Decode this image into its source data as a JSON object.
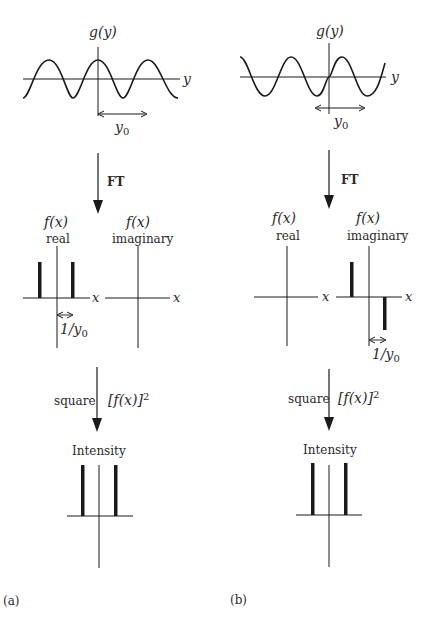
{
  "figure": {
    "panels": [
      {
        "id": "a",
        "caption": "(a)",
        "top_plot": {
          "function_label": "g(y)",
          "axis_label": "y",
          "period_label": "y",
          "period_sub": "0",
          "waveform": "cosine"
        },
        "transform_1": {
          "label": "FT"
        },
        "middle_plots": {
          "real": {
            "function_label": "f(x)",
            "sublabel": "real",
            "axis_label": "x",
            "spacing_label": "1/y",
            "spacing_sub": "0",
            "spikes": [
              {
                "pos": -1,
                "height": 1
              },
              {
                "pos": 1,
                "height": 1
              }
            ]
          },
          "imaginary": {
            "function_label": "f(x)",
            "sublabel": "imaginary",
            "axis_label": "x",
            "spikes": []
          }
        },
        "transform_2": {
          "label": "square",
          "expression": "[f(x)]",
          "exponent": "2"
        },
        "bottom_plot": {
          "title": "Intensity",
          "spikes": [
            {
              "pos": -1,
              "height": 1
            },
            {
              "pos": 1,
              "height": 1
            }
          ]
        }
      },
      {
        "id": "b",
        "caption": "(b)",
        "top_plot": {
          "function_label": "g(y)",
          "axis_label": "y",
          "period_label": "y",
          "period_sub": "0",
          "waveform": "sine"
        },
        "transform_1": {
          "label": "FT"
        },
        "middle_plots": {
          "real": {
            "function_label": "f(x)",
            "sublabel": "real",
            "axis_label": "x",
            "spikes": []
          },
          "imaginary": {
            "function_label": "f(x)",
            "sublabel": "imaginary",
            "axis_label": "x",
            "spacing_label": "1/y",
            "spacing_sub": "0",
            "spikes": [
              {
                "pos": -1,
                "height": 1
              },
              {
                "pos": 1,
                "height": -1
              }
            ]
          }
        },
        "transform_2": {
          "label": "square",
          "expression": "[f(x)]",
          "exponent": "2"
        },
        "bottom_plot": {
          "title": "Intensity",
          "spikes": [
            {
              "pos": -1,
              "height": 1
            },
            {
              "pos": 1,
              "height": 1
            }
          ]
        }
      }
    ],
    "colors": {
      "line": "#1a1a1a",
      "text": "#2a2a2a",
      "background": "#ffffff"
    }
  }
}
